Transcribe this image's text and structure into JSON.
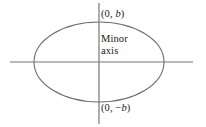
{
  "figure": {
    "kind": "ellipse-minor-axis-diagram",
    "width": 206,
    "height": 127,
    "background_color": "#ffffff",
    "stroke_color": "#777777",
    "text_color": "#1a1a1a"
  },
  "geometry": {
    "center": {
      "x": 99,
      "y": 62
    },
    "ellipse": {
      "semi_major_x": 65,
      "semi_minor_y": 40
    },
    "x_axis": {
      "x1": 10,
      "y1": 62,
      "x2": 193,
      "y2": 62
    },
    "y_axis": {
      "x1": 99,
      "y1": 3,
      "x2": 99,
      "y2": 124
    }
  },
  "labels": {
    "vertex_top": {
      "open_paren": "(0, ",
      "variable": "b",
      "close_paren": ")",
      "full": "(0, b)"
    },
    "vertex_bottom": {
      "open_paren": "(0, −",
      "variable": "b",
      "close_paren": ")",
      "full": "(0, −b)"
    },
    "minor_axis": {
      "line1": "Minor",
      "line2": "axis",
      "full": "Minor axis"
    }
  }
}
